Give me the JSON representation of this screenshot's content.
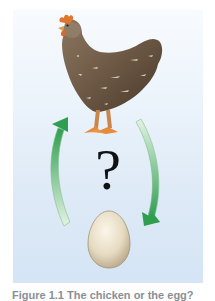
{
  "figure": {
    "question_mark": "?",
    "caption": "Figure 1.1 The chicken or the egg?",
    "subjects": [
      "chicken",
      "egg"
    ],
    "colors": {
      "panel_top": "#f8fbfe",
      "panel_bottom": "#d5e5f5",
      "arrow_green_dark": "#3aa55a",
      "arrow_green_light": "#d9efd9",
      "chicken_body": "#6e5a47",
      "chicken_comb": "#e0752e",
      "chicken_feet": "#e58a3a",
      "egg": "#e8dcc2"
    }
  }
}
